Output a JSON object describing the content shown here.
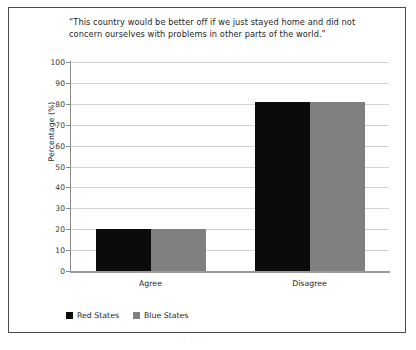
{
  "chart_data": {
    "type": "bar",
    "title": "“This country would be better off if we just stayed home and did not concern ourselves with problems in other parts of the world.”",
    "categories": [
      "Agree",
      "Disagree"
    ],
    "series": [
      {
        "name": "Red States",
        "values": [
          20,
          81
        ],
        "color": "#0b0b0b"
      },
      {
        "name": "Blue States",
        "values": [
          20,
          81
        ],
        "color": "#808080"
      }
    ],
    "xlabel": "",
    "ylabel": "Percentage (%)",
    "ylim": [
      0,
      100
    ],
    "ytick_step": 10,
    "yticks": [
      0,
      10,
      20,
      30,
      40,
      50,
      60,
      70,
      80,
      90,
      100
    ],
    "ytick_labels": [
      "0",
      "10",
      "20",
      "30",
      "40",
      "50",
      "60",
      "70",
      "80",
      "90",
      "100"
    ],
    "grid": true,
    "grid_axis": "y",
    "legend_position": "bottom-left",
    "bar_group_layout": "grouped"
  },
  "figure": {
    "border_color": "#4a4a4a",
    "background": "#ffffff",
    "grid_color": "#d3d3d3",
    "axis_color": "#8a8a8a"
  },
  "artifact": {
    "text": "·  ··  ·  ··  ·"
  }
}
